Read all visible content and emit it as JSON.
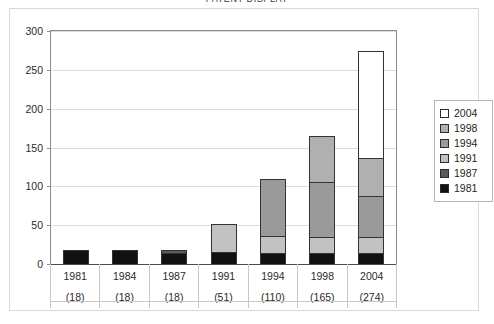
{
  "title": "PATENT DISPLAY",
  "chart_data": {
    "type": "bar",
    "title": "PATENT DISPLAY",
    "xlabel": "",
    "ylabel": "",
    "ylim": [
      0,
      300
    ],
    "yticks": [
      0,
      50,
      100,
      150,
      200,
      250,
      300
    ],
    "ytick_labels": [
      "0",
      "50",
      "100",
      "150",
      "200",
      "250",
      "300"
    ],
    "grid": true,
    "legend_position": "right",
    "stacked": true,
    "categories": [
      "1981",
      "1984",
      "1987",
      "1991",
      "1994",
      "1998",
      "2004"
    ],
    "category_counts": [
      "(18)",
      "(18)",
      "(18)",
      "(51)",
      "(110)",
      "(165)",
      "(274)"
    ],
    "totals": [
      18,
      18,
      18,
      51,
      110,
      165,
      274
    ],
    "series": [
      {
        "name": "1981",
        "color": "#111111",
        "values": [
          18,
          18,
          14,
          16,
          14,
          14,
          14
        ]
      },
      {
        "name": "1987",
        "color": "#5a5a5a",
        "values": [
          0,
          0,
          4,
          0,
          0,
          0,
          0
        ]
      },
      {
        "name": "1991",
        "color": "#c2c2c2",
        "values": [
          0,
          0,
          0,
          35,
          22,
          21,
          21
        ]
      },
      {
        "name": "1994",
        "color": "#9a9a9a",
        "values": [
          0,
          0,
          0,
          0,
          74,
          70,
          53
        ]
      },
      {
        "name": "1998",
        "color": "#b0b0b0",
        "values": [
          0,
          0,
          0,
          0,
          0,
          60,
          49
        ]
      },
      {
        "name": "2004",
        "color": "#ffffff",
        "values": [
          0,
          0,
          0,
          0,
          0,
          0,
          137
        ]
      }
    ]
  },
  "legend": {
    "items": [
      {
        "label": "2004",
        "color": "#ffffff"
      },
      {
        "label": "1998",
        "color": "#b0b0b0"
      },
      {
        "label": "1994",
        "color": "#9a9a9a"
      },
      {
        "label": "1991",
        "color": "#c2c2c2"
      },
      {
        "label": "1987",
        "color": "#5a5a5a"
      },
      {
        "label": "1981",
        "color": "#111111"
      }
    ]
  }
}
